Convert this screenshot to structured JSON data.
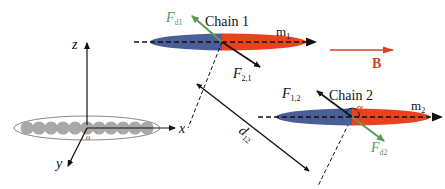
{
  "diagram": {
    "colors": {
      "chain_blue": "#4a5f9a",
      "chain_orange": "#e8431a",
      "dipolar_green": "#5a9a55",
      "field_red": "#d9402a",
      "axis_black": "#111111",
      "particle_grey": "#a8a8a8",
      "envelope_grey": "#8a8a8a"
    },
    "axes": {
      "z_label": "z",
      "x_label": "x",
      "y_label": "y",
      "origin_label": "o"
    },
    "chain1": {
      "label": "Chain 1",
      "moment_label": "m",
      "moment_sub": "1",
      "dipolar_force_label": "F",
      "dipolar_force_sub": "d1",
      "interaction_force_label": "F",
      "interaction_force_sub": "2,1"
    },
    "chain2": {
      "label": "Chain 2",
      "moment_label": "m",
      "moment_sub": "2",
      "dipolar_force_label": "F",
      "dipolar_force_sub": "d2",
      "interaction_force_label": "F",
      "interaction_force_sub": "1,2",
      "angle_label": "α"
    },
    "field": {
      "label": "B"
    },
    "distance": {
      "label": "d",
      "sub": "12"
    },
    "particles_count": 11
  }
}
